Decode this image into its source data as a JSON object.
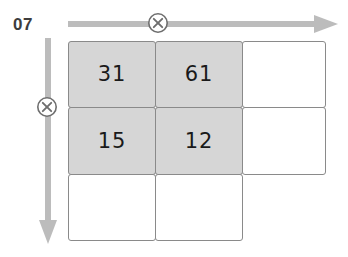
{
  "page": {
    "label": "07"
  },
  "colors": {
    "shaded_cell": "#d6d6d6",
    "cell_border": "#8a8a8a",
    "arrow": "#bcbcbc",
    "marker": "#6e6e6e",
    "text": "#1a1a1a",
    "page_label": "#3d3d3d",
    "background": "#ffffff"
  },
  "markers": [
    {
      "name": "column-multiply-marker",
      "icon": "circled-x-icon",
      "glyph": "⊗",
      "axis": "horizontal"
    },
    {
      "name": "row-multiply-marker",
      "icon": "circled-x-icon",
      "glyph": "⊗",
      "axis": "vertical"
    }
  ],
  "arrows": [
    {
      "name": "horizontal-arrow",
      "direction": "right",
      "icon": "arrow-right-icon"
    },
    {
      "name": "vertical-arrow",
      "direction": "down",
      "icon": "arrow-down-icon"
    }
  ],
  "grid": {
    "columns": 3,
    "rows": 3,
    "cells": [
      {
        "row": 0,
        "col": 0,
        "value": "31",
        "shaded": true
      },
      {
        "row": 0,
        "col": 1,
        "value": "61",
        "shaded": true
      },
      {
        "row": 0,
        "col": 2,
        "value": "",
        "shaded": false
      },
      {
        "row": 1,
        "col": 0,
        "value": "15",
        "shaded": true
      },
      {
        "row": 1,
        "col": 1,
        "value": "12",
        "shaded": true
      },
      {
        "row": 1,
        "col": 2,
        "value": "",
        "shaded": false
      },
      {
        "row": 2,
        "col": 0,
        "value": "",
        "shaded": false
      },
      {
        "row": 2,
        "col": 1,
        "value": "",
        "shaded": false
      }
    ]
  }
}
